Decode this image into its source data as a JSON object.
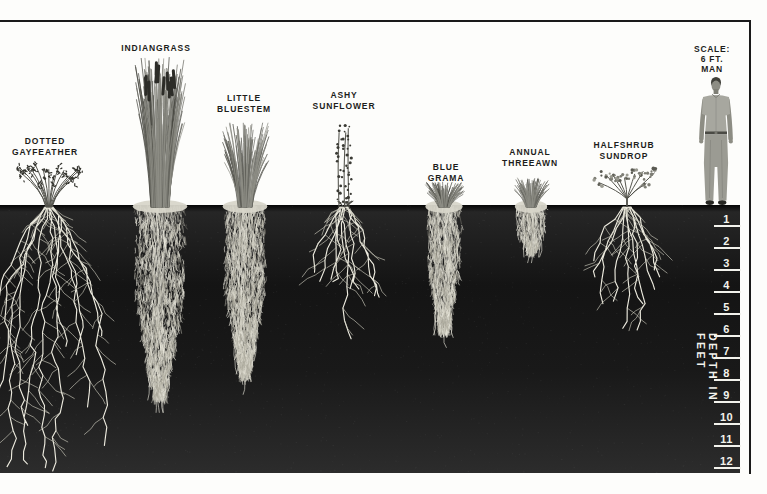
{
  "canvas": {
    "width": 767,
    "height": 494
  },
  "colors": {
    "background": "#fdfdfb",
    "frame": "#1a1a1a",
    "soil": "#181818",
    "root_bright": "#eceade",
    "root_mid": "#cfcdc0",
    "root_dim": "#a39f93",
    "label_text": "#1d1d1b",
    "scale_text": "#f2f2ec"
  },
  "layout": {
    "soil_y": 205,
    "soil_bottom_y": 473,
    "soil_right_x": 740,
    "frame_top_y": 20,
    "frame_right_x": 749,
    "px_per_foot": 22
  },
  "scale_label": {
    "lines": [
      "SCALE:",
      "6 FT.",
      "MAN"
    ]
  },
  "man": {
    "label": "six-foot man",
    "cx": 716,
    "feet_y": 205,
    "height_px": 128,
    "height_ft": 6
  },
  "depth_axis": {
    "label": "DEPTH IN FEET",
    "unit": "feet",
    "ticks": [
      "1",
      "2",
      "3",
      "4",
      "5",
      "6",
      "7",
      "8",
      "9",
      "10",
      "11",
      "12"
    ]
  },
  "plants": [
    {
      "name": "Dotted Gayfeather",
      "label_lines": [
        "DOTTED",
        "GAYFEATHER"
      ],
      "label_cx": 45,
      "label_y": 136,
      "cx": 49,
      "height_ft": 2,
      "root_depth_ft": 12,
      "top": {
        "style": "gayfeather",
        "width": 64,
        "height": 44
      },
      "root": {
        "style": "branching",
        "depth_px": 264,
        "spread": 112,
        "mains": 12,
        "shallow": false,
        "seed": 11
      }
    },
    {
      "name": "Indiangrass",
      "label_lines": [
        "INDIANGRASS"
      ],
      "label_cx": 156,
      "label_y": 43,
      "cx": 160,
      "height_ft": 7,
      "root_depth_ft": 8.7,
      "top": {
        "style": "tallgrass",
        "width": 52,
        "height": 150
      },
      "root": {
        "style": "fibrous",
        "depth_px": 192,
        "width": 44,
        "seed": 22
      }
    },
    {
      "name": "Little Bluestem",
      "label_lines": [
        "LITTLE",
        "BLUESTEM"
      ],
      "label_cx": 244,
      "label_y": 93,
      "cx": 245,
      "height_ft": 4,
      "root_depth_ft": 7.7,
      "top": {
        "style": "grass",
        "width": 40,
        "height": 85
      },
      "root": {
        "style": "fibrous",
        "depth_px": 170,
        "width": 36,
        "seed": 33
      }
    },
    {
      "name": "Ashy Sunflower",
      "label_lines": [
        "ASHY",
        "SUNFLOWER"
      ],
      "label_cx": 344,
      "label_y": 90,
      "cx": 344,
      "height_ft": 3.7,
      "root_depth_ft": 6,
      "top": {
        "style": "sunflower",
        "width": 18,
        "height": 82
      },
      "root": {
        "style": "branching",
        "depth_px": 132,
        "spread": 80,
        "mains": 9,
        "shallow": false,
        "seed": 44
      }
    },
    {
      "name": "Blue Grama",
      "label_lines": [
        "BLUE",
        "GRAMA"
      ],
      "label_cx": 446,
      "label_y": 162,
      "cx": 444,
      "height_ft": 1.2,
      "root_depth_ft": 5.7,
      "top": {
        "style": "grass",
        "width": 32,
        "height": 25
      },
      "root": {
        "style": "fibrous",
        "depth_px": 125,
        "width": 30,
        "seed": 55
      }
    },
    {
      "name": "Annual Threeawn",
      "label_lines": [
        "ANNUAL",
        "THREEAWN"
      ],
      "label_cx": 530,
      "label_y": 147,
      "cx": 531,
      "height_ft": 1.3,
      "root_depth_ft": 2.1,
      "top": {
        "style": "grass",
        "width": 28,
        "height": 29
      },
      "root": {
        "style": "fibrous",
        "depth_px": 46,
        "width": 26,
        "seed": 66
      }
    },
    {
      "name": "Halfshrub Sundrop",
      "label_lines": [
        "HALFSHRUB",
        "SUNDROP"
      ],
      "label_cx": 624,
      "label_y": 140,
      "cx": 627,
      "height_ft": 1.6,
      "root_depth_ft": 5.6,
      "top": {
        "style": "shrub",
        "width": 58,
        "height": 37
      },
      "root": {
        "style": "branching",
        "depth_px": 123,
        "spread": 110,
        "mains": 10,
        "shallow": true,
        "seed": 77
      }
    }
  ]
}
